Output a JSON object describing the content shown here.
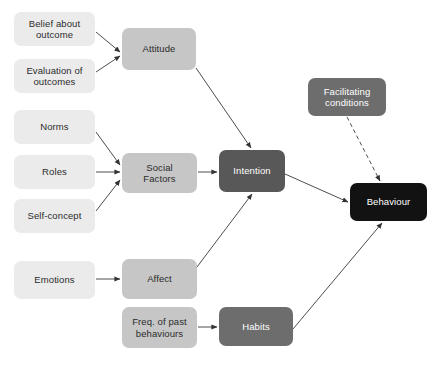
{
  "diagram": {
    "background": "#ffffff",
    "edge_color": "#4d4d4d",
    "palette": {
      "light": "#ebebeb",
      "mid": "#c6c6c6",
      "dark": "#6d6d6d",
      "darker": "#585858",
      "black": "#121212"
    },
    "nodes": [
      {
        "id": "belief",
        "label": "Belief about\noutcome",
        "tone": "light",
        "x": 14,
        "y": 12,
        "w": 81,
        "h": 34
      },
      {
        "id": "evaluation",
        "label": "Evaluation of\noutcomes",
        "tone": "light",
        "x": 14,
        "y": 59,
        "w": 81,
        "h": 34
      },
      {
        "id": "norms",
        "label": "Norms",
        "tone": "light",
        "x": 14,
        "y": 110,
        "w": 81,
        "h": 34
      },
      {
        "id": "roles",
        "label": "Roles",
        "tone": "light",
        "x": 14,
        "y": 155,
        "w": 81,
        "h": 34
      },
      {
        "id": "selfconcept",
        "label": "Self-concept",
        "tone": "light",
        "x": 14,
        "y": 199,
        "w": 81,
        "h": 34
      },
      {
        "id": "emotions",
        "label": "Emotions",
        "tone": "light",
        "x": 14,
        "y": 261,
        "w": 81,
        "h": 38
      },
      {
        "id": "attitude",
        "label": "Attitude",
        "tone": "mid",
        "x": 122,
        "y": 28,
        "w": 74,
        "h": 42
      },
      {
        "id": "social",
        "label": "Social\nFactors",
        "tone": "mid",
        "x": 122,
        "y": 153,
        "w": 75,
        "h": 40
      },
      {
        "id": "affect",
        "label": "Affect",
        "tone": "mid",
        "x": 122,
        "y": 259,
        "w": 75,
        "h": 40
      },
      {
        "id": "freqpast",
        "label": "Freq. of past\nbehaviours",
        "tone": "mid",
        "x": 122,
        "y": 307,
        "w": 75,
        "h": 41
      },
      {
        "id": "intention",
        "label": "Intention",
        "tone": "darker",
        "x": 219,
        "y": 150,
        "w": 66,
        "h": 42
      },
      {
        "id": "facilitate",
        "label": "Facilitating\nconditions",
        "tone": "dark",
        "x": 308,
        "y": 78,
        "w": 78,
        "h": 38
      },
      {
        "id": "habits",
        "label": "Habits",
        "tone": "dark",
        "x": 219,
        "y": 307,
        "w": 74,
        "h": 39
      },
      {
        "id": "behaviour",
        "label": "Behaviour",
        "tone": "black",
        "x": 350,
        "y": 183,
        "w": 77,
        "h": 38
      }
    ],
    "edges": [
      {
        "id": "belief-attitude",
        "from": "belief",
        "to": "attitude",
        "style": "solid",
        "x1": 96,
        "y1": 32,
        "x2": 120,
        "y2": 52
      },
      {
        "id": "evaluation-attitude",
        "from": "evaluation",
        "to": "attitude",
        "style": "solid",
        "x1": 96,
        "y1": 72,
        "x2": 120,
        "y2": 56
      },
      {
        "id": "norms-social",
        "from": "norms",
        "to": "social",
        "style": "solid",
        "x1": 96,
        "y1": 132,
        "x2": 120,
        "y2": 165
      },
      {
        "id": "roles-social",
        "from": "roles",
        "to": "social",
        "style": "solid",
        "x1": 96,
        "y1": 172,
        "x2": 120,
        "y2": 172
      },
      {
        "id": "selfconcept-social",
        "from": "selfconcept",
        "to": "social",
        "style": "solid",
        "x1": 96,
        "y1": 211,
        "x2": 120,
        "y2": 180
      },
      {
        "id": "emotions-affect",
        "from": "emotions",
        "to": "affect",
        "style": "solid",
        "x1": 96,
        "y1": 279,
        "x2": 120,
        "y2": 279
      },
      {
        "id": "freqpast-habits",
        "from": "freqpast",
        "to": "habits",
        "style": "solid",
        "x1": 198,
        "y1": 327,
        "x2": 217,
        "y2": 327
      },
      {
        "id": "attitude-intention",
        "from": "attitude",
        "to": "intention",
        "style": "solid",
        "x1": 196,
        "y1": 68,
        "x2": 251,
        "y2": 148
      },
      {
        "id": "social-intention",
        "from": "social",
        "to": "intention",
        "style": "solid",
        "x1": 198,
        "y1": 172,
        "x2": 217,
        "y2": 172
      },
      {
        "id": "affect-intention",
        "from": "affect",
        "to": "intention",
        "style": "solid",
        "x1": 197,
        "y1": 267,
        "x2": 252,
        "y2": 194
      },
      {
        "id": "intention-behaviour",
        "from": "intention",
        "to": "behaviour",
        "style": "solid",
        "x1": 285,
        "y1": 174,
        "x2": 348,
        "y2": 202
      },
      {
        "id": "facilitate-behaviour",
        "from": "facilitate",
        "to": "behaviour",
        "style": "dashed",
        "x1": 347,
        "y1": 117,
        "x2": 380,
        "y2": 181
      },
      {
        "id": "habits-behaviour",
        "from": "habits",
        "to": "behaviour",
        "style": "solid",
        "x1": 293,
        "y1": 329,
        "x2": 382,
        "y2": 223
      }
    ]
  }
}
